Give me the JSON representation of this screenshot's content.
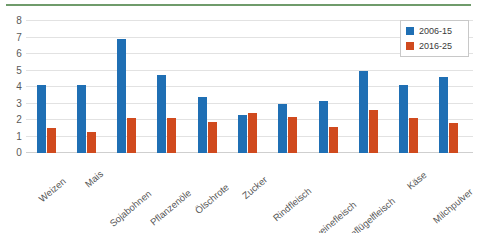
{
  "chart_data": {
    "type": "bar",
    "title": "",
    "xlabel": "",
    "ylabel": "",
    "ylim": [
      0,
      8
    ],
    "yticks": [
      0,
      1,
      2,
      3,
      4,
      5,
      6,
      7,
      8
    ],
    "grid": true,
    "legend_position": "top-right",
    "categories": [
      "Weizen",
      "Mais",
      "Sojabohnen",
      "Pflanzenöle",
      "Ölschrote",
      "Zucker",
      "Rindfleisch",
      "Schweinefleisch",
      "Geflügelfleisch",
      "Käse",
      "Milchpulver"
    ],
    "series": [
      {
        "name": "2006-15",
        "color": "#1f6fb4",
        "values": [
          4.15,
          4.1,
          6.9,
          4.75,
          3.4,
          2.3,
          2.95,
          3.15,
          4.95,
          4.15,
          4.6
        ]
      },
      {
        "name": "2016-25",
        "color": "#d04a1e",
        "values": [
          1.5,
          1.25,
          2.1,
          2.1,
          1.9,
          2.4,
          2.2,
          1.55,
          2.6,
          2.1,
          1.8
        ]
      }
    ]
  },
  "legend": {
    "entries": [
      {
        "label": "2006-15"
      },
      {
        "label": "2016-25"
      }
    ]
  },
  "colors": {
    "series_0": "#1f6fb4",
    "series_1": "#d04a1e",
    "top_rule": "#6f9b6b",
    "gridline": "#e2e2e2",
    "axis_text": "#555555"
  }
}
